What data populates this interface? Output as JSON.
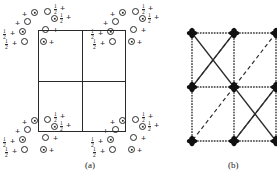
{
  "figure": {
    "type": "crystal-structure-diagram",
    "panels": [
      {
        "id": "a",
        "caption": "(a)",
        "description": "unit cell square divided into four quadrants with atom clusters at corners",
        "cell": {
          "x": 38,
          "y": 30,
          "w": 88,
          "h": 102,
          "subdivisions": 4
        },
        "symbols": {
          "open_circle": "open-circle",
          "dotted_circle": "dotted-circle",
          "plus": "+",
          "height_label": "1/2"
        },
        "clusters": [
          {
            "name": "cluster-top-left",
            "items": [
              {
                "t": "plus",
                "x": 22,
                "y": 10
              },
              {
                "t": "dotted",
                "x": 31,
                "y": 9
              },
              {
                "t": "open",
                "x": 44,
                "y": 8
              },
              {
                "t": "frac",
                "x": 54,
                "y": 4
              },
              {
                "t": "plus",
                "x": 60,
                "y": 4
              },
              {
                "t": "plus",
                "x": 15,
                "y": 19
              },
              {
                "t": "open",
                "x": 24,
                "y": 18
              },
              {
                "t": "dotted",
                "x": 51,
                "y": 15
              },
              {
                "t": "frac",
                "x": 60,
                "y": 13
              },
              {
                "t": "plus",
                "x": 66,
                "y": 13
              },
              {
                "t": "frac",
                "x": 3,
                "y": 29
              },
              {
                "t": "plus",
                "x": 10,
                "y": 29
              },
              {
                "t": "dotted",
                "x": 19,
                "y": 28
              },
              {
                "t": "open",
                "x": 42,
                "y": 26
              },
              {
                "t": "plus",
                "x": 53,
                "y": 26
              },
              {
                "t": "frac",
                "x": 5,
                "y": 39
              },
              {
                "t": "plus",
                "x": 12,
                "y": 39
              },
              {
                "t": "open",
                "x": 21,
                "y": 38
              },
              {
                "t": "dotted",
                "x": 40,
                "y": 38
              },
              {
                "t": "plus",
                "x": 49,
                "y": 38
              }
            ]
          },
          {
            "name": "cluster-top-right",
            "items": [
              {
                "t": "plus",
                "x": 110,
                "y": 10
              },
              {
                "t": "dotted",
                "x": 119,
                "y": 9
              },
              {
                "t": "open",
                "x": 132,
                "y": 8
              },
              {
                "t": "frac",
                "x": 142,
                "y": 4
              },
              {
                "t": "plus",
                "x": 148,
                "y": 4
              },
              {
                "t": "plus",
                "x": 103,
                "y": 19
              },
              {
                "t": "open",
                "x": 112,
                "y": 18
              },
              {
                "t": "dotted",
                "x": 139,
                "y": 15
              },
              {
                "t": "frac",
                "x": 148,
                "y": 13
              },
              {
                "t": "plus",
                "x": 154,
                "y": 13
              },
              {
                "t": "frac",
                "x": 91,
                "y": 29
              },
              {
                "t": "plus",
                "x": 98,
                "y": 29
              },
              {
                "t": "dotted",
                "x": 107,
                "y": 28
              },
              {
                "t": "open",
                "x": 130,
                "y": 26
              },
              {
                "t": "plus",
                "x": 141,
                "y": 26
              },
              {
                "t": "frac",
                "x": 93,
                "y": 39
              },
              {
                "t": "plus",
                "x": 100,
                "y": 39
              },
              {
                "t": "open",
                "x": 109,
                "y": 38
              },
              {
                "t": "dotted",
                "x": 128,
                "y": 38
              },
              {
                "t": "plus",
                "x": 137,
                "y": 38
              }
            ]
          },
          {
            "name": "cluster-bottom-left",
            "items": [
              {
                "t": "plus",
                "x": 22,
                "y": 118
              },
              {
                "t": "dotted",
                "x": 31,
                "y": 117
              },
              {
                "t": "open",
                "x": 44,
                "y": 116
              },
              {
                "t": "frac",
                "x": 54,
                "y": 112
              },
              {
                "t": "plus",
                "x": 60,
                "y": 112
              },
              {
                "t": "plus",
                "x": 15,
                "y": 127
              },
              {
                "t": "open",
                "x": 24,
                "y": 126
              },
              {
                "t": "dotted",
                "x": 51,
                "y": 123
              },
              {
                "t": "frac",
                "x": 60,
                "y": 121
              },
              {
                "t": "plus",
                "x": 66,
                "y": 121
              },
              {
                "t": "frac",
                "x": 3,
                "y": 137
              },
              {
                "t": "plus",
                "x": 10,
                "y": 137
              },
              {
                "t": "dotted",
                "x": 19,
                "y": 136
              },
              {
                "t": "open",
                "x": 42,
                "y": 134
              },
              {
                "t": "plus",
                "x": 53,
                "y": 134
              },
              {
                "t": "frac",
                "x": 5,
                "y": 147
              },
              {
                "t": "plus",
                "x": 12,
                "y": 147
              },
              {
                "t": "open",
                "x": 21,
                "y": 146
              },
              {
                "t": "dotted",
                "x": 40,
                "y": 146
              },
              {
                "t": "plus",
                "x": 49,
                "y": 146
              }
            ]
          },
          {
            "name": "cluster-bottom-right",
            "items": [
              {
                "t": "plus",
                "x": 110,
                "y": 118
              },
              {
                "t": "dotted",
                "x": 119,
                "y": 117
              },
              {
                "t": "open",
                "x": 132,
                "y": 116
              },
              {
                "t": "frac",
                "x": 142,
                "y": 112
              },
              {
                "t": "plus",
                "x": 148,
                "y": 112
              },
              {
                "t": "plus",
                "x": 103,
                "y": 127
              },
              {
                "t": "open",
                "x": 112,
                "y": 126
              },
              {
                "t": "dotted",
                "x": 139,
                "y": 123
              },
              {
                "t": "frac",
                "x": 148,
                "y": 121
              },
              {
                "t": "plus",
                "x": 154,
                "y": 121
              },
              {
                "t": "frac",
                "x": 91,
                "y": 137
              },
              {
                "t": "plus",
                "x": 98,
                "y": 137
              },
              {
                "t": "dotted",
                "x": 107,
                "y": 136
              },
              {
                "t": "open",
                "x": 130,
                "y": 134
              },
              {
                "t": "plus",
                "x": 141,
                "y": 134
              },
              {
                "t": "frac",
                "x": 93,
                "y": 147
              },
              {
                "t": "plus",
                "x": 100,
                "y": 147
              },
              {
                "t": "open",
                "x": 109,
                "y": 146
              },
              {
                "t": "dotted",
                "x": 128,
                "y": 146
              },
              {
                "t": "plus",
                "x": 137,
                "y": 146
              }
            ]
          }
        ]
      },
      {
        "id": "b",
        "caption": "(b)",
        "description": "lattice net of filled nodes joined by dotted axial lines and solid/dashed diagonal bonds",
        "nodes": [
          {
            "x": 22,
            "y": 33
          },
          {
            "x": 64,
            "y": 33
          },
          {
            "x": 106,
            "y": 33
          },
          {
            "x": 22,
            "y": 87
          },
          {
            "x": 64,
            "y": 87
          },
          {
            "x": 106,
            "y": 87
          },
          {
            "x": 22,
            "y": 141
          },
          {
            "x": 64,
            "y": 141
          },
          {
            "x": 106,
            "y": 141
          }
        ],
        "dotted_edges": [
          [
            0,
            1
          ],
          [
            1,
            2
          ],
          [
            3,
            4
          ],
          [
            4,
            5
          ],
          [
            6,
            7
          ],
          [
            7,
            8
          ],
          [
            0,
            3
          ],
          [
            3,
            6
          ],
          [
            1,
            4
          ],
          [
            4,
            7
          ],
          [
            2,
            5
          ],
          [
            5,
            8
          ]
        ],
        "solid_edges": [
          [
            0,
            4
          ],
          [
            4,
            8
          ],
          [
            3,
            1
          ],
          [
            7,
            5
          ]
        ],
        "dashed_edges": [
          [
            1,
            3
          ],
          [
            4,
            6
          ],
          [
            2,
            4
          ],
          [
            5,
            7
          ]
        ]
      }
    ]
  }
}
